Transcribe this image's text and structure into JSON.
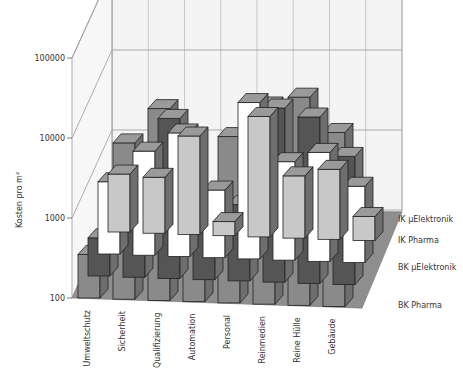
{
  "chart_data": {
    "type": "bar",
    "subtype": "3d-bar-log",
    "title": "",
    "ylabel": "Kosten pro m²",
    "xlabel": "",
    "yscale": "log",
    "ylim": [
      100,
      100000
    ],
    "yticks": [
      "100",
      "1000",
      "10000",
      "100000"
    ],
    "grid": true,
    "categories": [
      "Umweltschutz",
      "Sicherheit",
      "Qualifizierung",
      "Automation",
      "Personal",
      "Reinmedien",
      "Reine Hülle",
      "Gebäude"
    ],
    "series": [
      {
        "name": "BK Pharma",
        "color": "#c8c8c8",
        "values": [
          530,
          500,
          1700,
          150,
          3200,
          600,
          750,
          200
        ]
      },
      {
        "name": "BK µElektronik",
        "color": "#ffffff",
        "values": [
          800,
          2000,
          3500,
          700,
          9000,
          1700,
          2300,
          900
        ]
      },
      {
        "name": "IK Pharma",
        "color": "#555555",
        "values": [
          300,
          900,
          10000,
          500,
          900,
          15000,
          12000,
          4000
        ]
      },
      {
        "name": "IK µElektronik",
        "color": "#8a8a8a",
        "values": [
          350,
          9000,
          25000,
          600,
          12000,
          30000,
          40000,
          15000
        ]
      }
    ],
    "legend_position": "right (depth axis)"
  }
}
